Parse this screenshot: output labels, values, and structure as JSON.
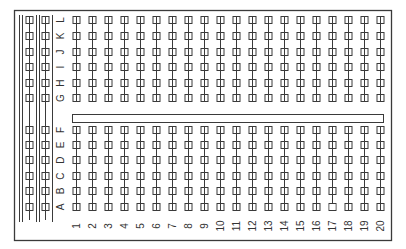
{
  "diagram": {
    "colors": {
      "background": "#ffffff",
      "stroke": "#3a3a3a",
      "label": "#333333"
    },
    "column_labels_top": [
      "G",
      "H",
      "I",
      "J",
      "K",
      "L"
    ],
    "column_labels_bottom": [
      "A",
      "B",
      "C",
      "D",
      "E",
      "F"
    ],
    "row_numbers": [
      "1",
      "2",
      "3",
      "4",
      "5",
      "6",
      "7",
      "8",
      "9",
      "10",
      "11",
      "12",
      "13",
      "14",
      "15",
      "16",
      "17",
      "18",
      "19",
      "20"
    ],
    "power_rails": {
      "count": 2,
      "holes_per_rail_top": 6,
      "holes_per_rail_bottom": 6
    },
    "center_channel": true,
    "unconnected_holes": [
      {
        "row": "17",
        "column": "A"
      }
    ]
  }
}
